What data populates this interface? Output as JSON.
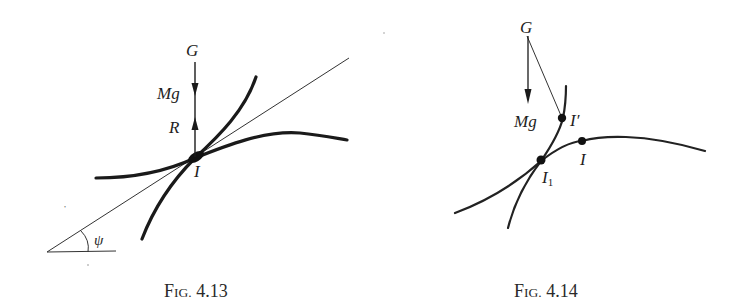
{
  "figures": [
    {
      "id": "fig-4-13",
      "caption": {
        "prefix": "F",
        "smallcaps": "IG.",
        "number": " 4.13"
      },
      "labels": {
        "centre_of_gravity": "G",
        "weight": "Mg",
        "reaction": "R",
        "contact_point": "I",
        "angle": "ψ"
      }
    },
    {
      "id": "fig-4-14",
      "caption": {
        "prefix": "F",
        "smallcaps": "IG.",
        "number": " 4.14"
      },
      "labels": {
        "centre_of_gravity": "G",
        "weight": "Mg",
        "contact_point_prime": "I′",
        "contact_point": "I",
        "contact_point_1_base": "I",
        "contact_point_1_sub": "1"
      }
    }
  ]
}
